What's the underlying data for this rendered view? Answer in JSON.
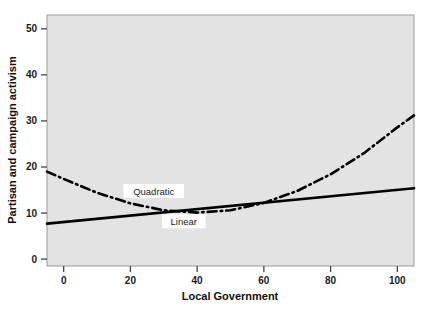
{
  "chart_data": {
    "type": "line",
    "title": "",
    "xlabel": "Local Government",
    "ylabel": "Partisan and campaign activism",
    "xlim": [
      -5,
      105
    ],
    "ylim": [
      -1.5,
      53
    ],
    "xticks": [
      0,
      20,
      40,
      60,
      80,
      100
    ],
    "yticks": [
      0,
      10,
      20,
      30,
      40,
      50
    ],
    "xtick_labels": [
      "0",
      "20",
      "40",
      "60",
      "80",
      "100"
    ],
    "ytick_labels": [
      "0",
      "10",
      "20",
      "30",
      "40",
      "50"
    ],
    "grid": false,
    "legend_position": "inline-annotations",
    "plot_background": "#e3e3e3",
    "line_color": "#000000",
    "series": [
      {
        "name": "Linear",
        "style": "solid",
        "label_x": 36,
        "label_y": 8.2,
        "x": [
          -5,
          105
        ],
        "values": [
          7.7,
          15.4
        ]
      },
      {
        "name": "Quadratic",
        "style": "dash-dot",
        "label_x": 27,
        "label_y": 14.8,
        "x": [
          -5,
          0,
          10,
          20,
          30,
          40,
          50,
          60,
          70,
          80,
          90,
          100,
          105
        ],
        "values": [
          19.0,
          17.4,
          14.4,
          12.1,
          10.6,
          10.1,
          10.6,
          12.2,
          14.8,
          18.4,
          23.0,
          28.6,
          31.2
        ]
      }
    ],
    "annotations": [
      {
        "text": "Quadratic",
        "x": 27,
        "y": 14.8
      },
      {
        "text": "Linear",
        "x": 36,
        "y": 8.2
      }
    ]
  },
  "axis": {
    "x_title": "Local Government",
    "y_title": "Partisan and campaign activism"
  }
}
